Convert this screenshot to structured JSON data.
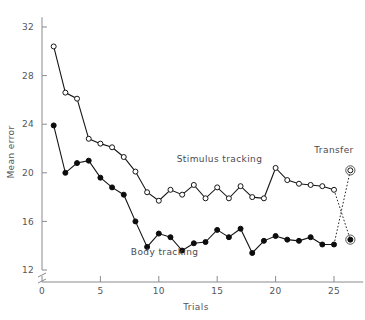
{
  "chart_data": {
    "type": "line",
    "title": "",
    "xlabel": "Trials",
    "ylabel": "Mean error",
    "xlim": [
      0,
      27.5
    ],
    "ylim": [
      12,
      32.8
    ],
    "xticks": [
      0,
      5,
      10,
      15,
      20,
      25
    ],
    "xtick_labels": [
      "0",
      "5",
      "10",
      "15",
      "20",
      "25"
    ],
    "yticks": [
      12,
      16,
      20,
      24,
      28,
      32
    ],
    "ytick_labels": [
      "12",
      "16",
      "20",
      "24",
      "28",
      "32"
    ],
    "grid": false,
    "axis_break": true,
    "legend_position": "inline-annotation",
    "series": [
      {
        "name": "Stimulus tracking",
        "marker": "open-circle",
        "label_x": 15.2,
        "label_y": 20.9,
        "x": [
          1,
          2,
          3,
          4,
          5,
          6,
          7,
          8,
          9,
          10,
          11,
          12,
          13,
          14,
          15,
          16,
          17,
          18,
          19,
          20,
          21,
          22,
          23,
          24,
          25
        ],
        "values": [
          30.4,
          26.6,
          26.1,
          22.8,
          22.4,
          22.1,
          21.3,
          20.1,
          18.4,
          17.7,
          18.6,
          18.2,
          19.0,
          17.9,
          18.8,
          17.9,
          18.9,
          18.0,
          17.9,
          20.4,
          19.4,
          19.1,
          19.0,
          18.9,
          18.6
        ]
      },
      {
        "name": "Body tracking",
        "marker": "filled-circle",
        "label_x": 10.5,
        "label_y": 13.2,
        "x": [
          1,
          2,
          3,
          4,
          5,
          6,
          7,
          8,
          9,
          10,
          11,
          12,
          13,
          14,
          15,
          16,
          17,
          18,
          19,
          20,
          21,
          22,
          23,
          24,
          25
        ],
        "values": [
          23.9,
          20.0,
          20.8,
          21.0,
          19.6,
          18.8,
          18.2,
          16.0,
          13.9,
          15.0,
          14.7,
          13.6,
          14.2,
          14.3,
          15.3,
          14.7,
          15.4,
          13.4,
          14.4,
          14.8,
          14.5,
          14.4,
          14.7,
          14.1,
          14.1
        ]
      }
    ],
    "transfer": {
      "label": "Transfer",
      "label_x": 25.0,
      "label_y": 21.6,
      "points": [
        {
          "from_series": "Stimulus tracking",
          "x": 26.4,
          "y": 20.2,
          "marker": "open-circle-ringed"
        },
        {
          "from_series": "Body tracking",
          "x": 26.4,
          "y": 14.5,
          "marker": "filled-circle-ringed"
        }
      ],
      "connectors": [
        {
          "from_x": 25,
          "from_y": 18.6,
          "to_x": 26.4,
          "to_y": 14.5,
          "style": "dashed"
        },
        {
          "from_x": 25,
          "from_y": 14.1,
          "to_x": 26.4,
          "to_y": 20.2,
          "style": "dotted"
        }
      ]
    }
  }
}
